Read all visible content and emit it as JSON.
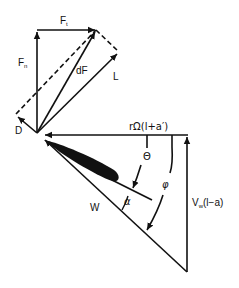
{
  "diagram": {
    "type": "blade-element velocity and force triangle",
    "colors": {
      "line": "#111111",
      "background": "#ffffff"
    },
    "labels": {
      "ft_main": "F",
      "ft_sub": "t",
      "fn_main": "F",
      "fn_sub": "n",
      "df": "dF",
      "lift": "L",
      "drag": "D",
      "rotational_velocity": "rΩ(l+a′)",
      "axial_velocity_main": "V",
      "axial_velocity_sub": "w",
      "axial_velocity_rest": "(l−a)",
      "relative_velocity": "W",
      "theta": "Θ",
      "phi": "φ",
      "alpha": "α"
    }
  }
}
